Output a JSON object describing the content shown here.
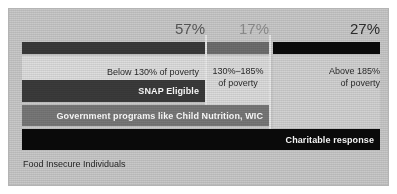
{
  "chart_data": {
    "type": "bar",
    "title": "",
    "subtitle": "",
    "xlabel": "",
    "ylabel": "",
    "orientation": "horizontal-stacked",
    "axis_note": "Food Insecure Individuals",
    "grid": false,
    "legend_position": "none",
    "categories": [
      "Below 130% of poverty",
      "130%–185% of poverty",
      "Above 185% of poverty"
    ],
    "values": [
      57,
      17,
      27
    ],
    "value_labels": [
      "57%",
      "27%",
      "17%"
    ],
    "series": [
      {
        "name": "Population share of food insecure individuals",
        "categories": [
          "Below 130% of poverty",
          "130%–185% of poverty",
          "Above 185% of poverty"
        ],
        "values": [
          57,
          17,
          27
        ]
      },
      {
        "name": "SNAP Eligible",
        "coverage_percent": 57,
        "covers_categories": [
          "Below 130% of poverty"
        ]
      },
      {
        "name": "Government programs like Child Nutrition, WIC",
        "coverage_percent": 74,
        "covers_categories": [
          "Below 130% of poverty",
          "130%–185% of poverty"
        ]
      },
      {
        "name": "Charitable response",
        "coverage_percent": 100,
        "covers_categories": [
          "Below 130% of poverty",
          "130%–185% of poverty",
          "Above 185% of poverty"
        ]
      }
    ],
    "xlim": [
      0,
      100
    ]
  },
  "header": {
    "percents": [
      {
        "value": "57%",
        "column": "below-130"
      },
      {
        "value": "17%",
        "column": "130-185"
      },
      {
        "value": "27%",
        "column": "above-185"
      }
    ]
  },
  "columns": {
    "left": {
      "caption_line1": "Below 130% of poverty",
      "caption_line2": ""
    },
    "mid": {
      "caption_line1": "130%–185%",
      "caption_line2": "of poverty"
    },
    "right": {
      "caption_line1": "Above 185%",
      "caption_line2": "of poverty"
    }
  },
  "bars": {
    "snap": {
      "label": "SNAP Eligible"
    },
    "govt": {
      "label": "Government programs like Child Nutrition, WIC"
    },
    "charity": {
      "label": "Charitable response"
    }
  },
  "footer": {
    "note": "Food Insecure Individuals"
  },
  "colors": {
    "plate": "#c9c9c9",
    "dark_gray": "#3a3a3a",
    "mid_gray": "#6e6e6e",
    "light_gray_bar": "#787878",
    "black": "#0a0a0a",
    "label_white": "#ffffff"
  }
}
